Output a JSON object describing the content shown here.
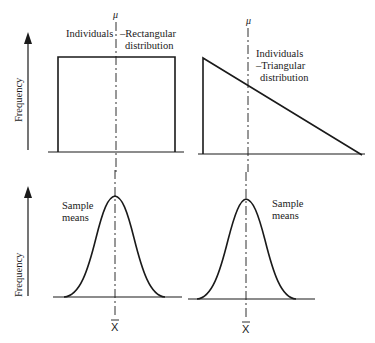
{
  "figure": {
    "mu_symbol": "μ",
    "xbar_symbol": "X",
    "y_axis_label": "Frequency",
    "panels": {
      "top_left": {
        "label_left": "Individuals",
        "label_right_line1": "–Rectangular",
        "label_right_line2": "distribution",
        "shape": "rectangular"
      },
      "top_right": {
        "label_line1": "Individuals",
        "label_line2": "–Triangular",
        "label_line3": "distribution",
        "shape": "triangular"
      },
      "bottom_left": {
        "label_line1": "Sample",
        "label_line2": "means",
        "shape": "normal"
      },
      "bottom_right": {
        "label_line1": "Sample",
        "label_line2": "means",
        "shape": "normal"
      }
    }
  }
}
